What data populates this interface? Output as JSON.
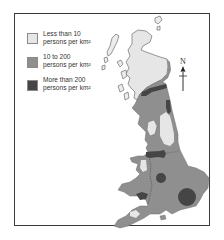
{
  "map": {
    "title": "",
    "subject": "Population density of Great Britain",
    "legend": [
      {
        "line1": "Less than 10",
        "line2": "persons per km²",
        "color": "#e6e6e6"
      },
      {
        "line1": "10 to 200",
        "line2": "persons per km²",
        "color": "#8f8f8f"
      },
      {
        "line1": "More than 200",
        "line2": "persons per km²",
        "color": "#454545"
      }
    ],
    "north_label": "N",
    "colors": {
      "frame": "#3a3a3a",
      "low": "#e6e6e6",
      "medium": "#8f8f8f",
      "high": "#454545",
      "outline": "#6d6d6d"
    }
  }
}
